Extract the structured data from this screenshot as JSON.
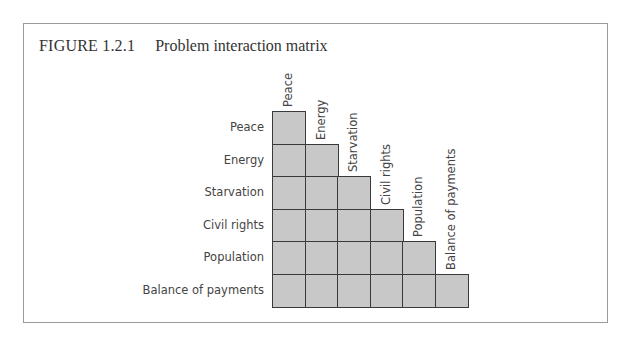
{
  "figure": {
    "number": "FIGURE 1.2.1",
    "title": "Problem interaction matrix"
  },
  "matrix": {
    "rows": [
      "Peace",
      "Energy",
      "Starvation",
      "Civil rights",
      "Population",
      "Balance of payments"
    ],
    "columns": [
      "Peace",
      "Energy",
      "Starvation",
      "Civil rights",
      "Population",
      "Balance of payments"
    ],
    "cell_color": "#c8c8c8",
    "type": "lower-triangular"
  }
}
